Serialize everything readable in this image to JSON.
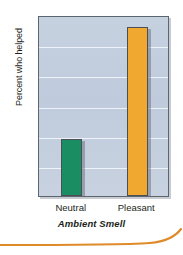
{
  "chart_data": {
    "type": "bar",
    "title": "",
    "xlabel": "Ambient Smell",
    "ylabel": "Percent who helped",
    "categories": [
      "Neutral",
      "Pleasant"
    ],
    "values": [
      19,
      56
    ],
    "series": [
      {
        "name": "Percent who helped",
        "values": [
          19,
          56
        ]
      }
    ],
    "ylim": [
      0,
      60
    ],
    "ytick_values": [
      60,
      50,
      40,
      30,
      20,
      10,
      0
    ],
    "yticks": [
      "60",
      "50",
      "40",
      "30",
      "20",
      "10",
      "0"
    ],
    "ytick_interval": 10,
    "grid": "horizontal",
    "legend": "none",
    "bar_colors": [
      "#1a8d63",
      "#f0a830"
    ],
    "plot_background": "#c3cfdf",
    "gridline_color": "#f2f6fb",
    "frame_color": "#5d6570",
    "text_color": "#231f20"
  },
  "decoration": {
    "swoosh_color": "#e08b2a",
    "swoosh_name": "orange-curve-rule"
  }
}
